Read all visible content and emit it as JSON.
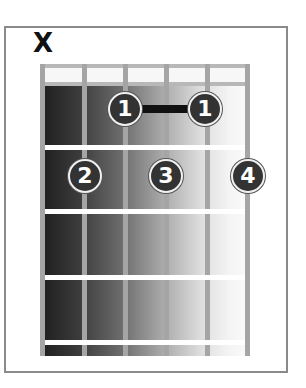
{
  "diagram": {
    "type": "chord-diagram",
    "instrument": "guitar",
    "strings_count": 6,
    "frets_shown": 4,
    "muted_strings": [
      {
        "string": 6,
        "symbol": "X"
      }
    ],
    "barre": {
      "finger": 1,
      "fret": 1,
      "from_string": 4,
      "to_string": 2
    },
    "fingers": [
      {
        "label": "1",
        "string": 4,
        "fret": 1
      },
      {
        "label": "1",
        "string": 2,
        "fret": 1
      },
      {
        "label": "2",
        "string": 5,
        "fret": 2
      },
      {
        "label": "3",
        "string": 3,
        "fret": 2
      },
      {
        "label": "4",
        "string": 1,
        "fret": 2
      }
    ],
    "colors": {
      "dot_fill": "#333333",
      "dot_text": "#ffffff",
      "barre": "#111111",
      "frame": "#8a8a8a",
      "string": "#a5a5a5",
      "fret": "#ffffff"
    }
  }
}
